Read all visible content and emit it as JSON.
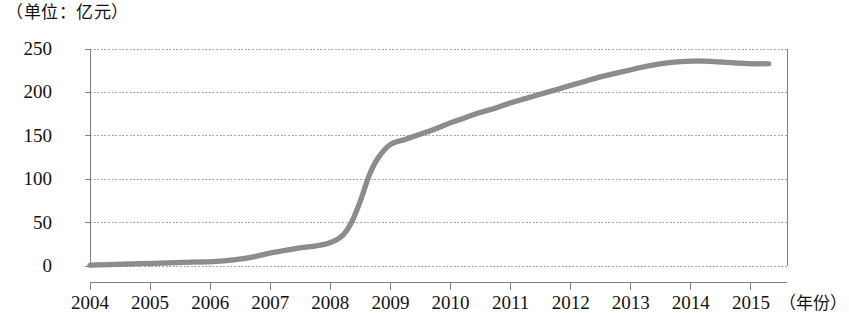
{
  "chart_data": {
    "type": "line",
    "title": "（单位：亿元）",
    "subtitle": "",
    "xlabel": "（年份）",
    "ylabel": "",
    "unit_note": "（单位：亿元）",
    "grid": true,
    "legend": "none",
    "xlim": [
      2004,
      2015.6
    ],
    "ylim": [
      0,
      250
    ],
    "x_tick_labels": [
      "2004",
      "2005",
      "2006",
      "2007",
      "2008",
      "2009",
      "2010",
      "2011",
      "2012",
      "2013",
      "2014",
      "2015"
    ],
    "x_ticks": [
      2004,
      2005,
      2006,
      2007,
      2008,
      2009,
      2010,
      2011,
      2012,
      2013,
      2014,
      2015
    ],
    "y_tick_labels": [
      "0",
      "50",
      "100",
      "150",
      "200",
      "250"
    ],
    "y_ticks": [
      0,
      50,
      100,
      150,
      200,
      250
    ],
    "series": [
      {
        "name": "累计规模",
        "color": "#8c8c8c",
        "x": [
          2004.0,
          2004.25,
          2004.5,
          2004.75,
          2005.0,
          2005.25,
          2005.5,
          2005.75,
          2006.0,
          2006.25,
          2006.5,
          2006.75,
          2007.0,
          2007.25,
          2007.5,
          2007.75,
          2008.0,
          2008.2,
          2008.35,
          2008.5,
          2008.65,
          2008.8,
          2009.0,
          2009.25,
          2009.5,
          2009.75,
          2010.0,
          2010.25,
          2010.5,
          2010.75,
          2011.0,
          2011.25,
          2011.5,
          2011.75,
          2012.0,
          2012.25,
          2012.5,
          2012.75,
          2013.0,
          2013.25,
          2013.5,
          2013.75,
          2014.0,
          2014.25,
          2014.5,
          2014.75,
          2015.0,
          2015.3
        ],
        "values": [
          1,
          1.5,
          2,
          2.5,
          3,
          3.5,
          4,
          4.5,
          5,
          6,
          8,
          11,
          15,
          18,
          21,
          23,
          27,
          35,
          50,
          75,
          105,
          125,
          140,
          146,
          152,
          158,
          165,
          171,
          177,
          182,
          188,
          193,
          198,
          203,
          208,
          213,
          218,
          222,
          226,
          230,
          233,
          235,
          236,
          236,
          235,
          234,
          233,
          233
        ]
      }
    ],
    "annotations": []
  },
  "axis": {
    "plot_left_px": 90,
    "plot_right_px": 787,
    "plot_top_px": 49,
    "plot_bottom_px": 266,
    "axis_line_color": "#808080",
    "grid_color": "#a6a6a6"
  }
}
